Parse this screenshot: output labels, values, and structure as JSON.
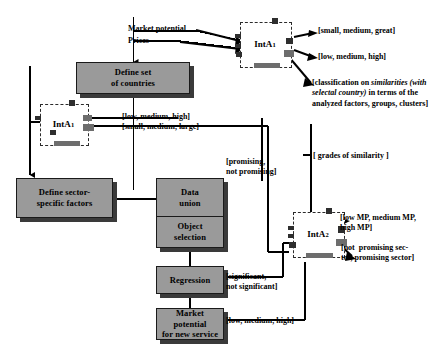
{
  "diagram": {
    "colors": {
      "box_fill": "#9a9a9a",
      "box_border": "#1a1a1a",
      "box_shadow": "#3a3a3a",
      "node_fill": "#ffffff",
      "node_border": "#2b2b2b",
      "line": "#000000",
      "background": "#ffffff"
    },
    "process_boxes": [
      {
        "id": "define-set-of-countries",
        "lines": [
          "Define set",
          "of countries"
        ]
      },
      {
        "id": "define-sector-specific-factors",
        "lines": [
          "Define sector-",
          "specific factors"
        ]
      },
      {
        "id": "data-union",
        "lines": [
          "Data",
          "union"
        ]
      },
      {
        "id": "object-selection",
        "lines": [
          "Object",
          "selection"
        ]
      },
      {
        "id": "regression",
        "lines": [
          "Regression"
        ]
      },
      {
        "id": "market-potential-for-new-service",
        "lines": [
          "Market potential",
          "for new service"
        ]
      }
    ],
    "interaction_nodes": [
      {
        "id": "inta1-top",
        "base": "IntA",
        "subscript": "1"
      },
      {
        "id": "inta1-left",
        "base": "IntA",
        "subscript": "1"
      },
      {
        "id": "inta2",
        "base": "IntA",
        "subscript": "2"
      }
    ],
    "input_labels": [
      {
        "id": "market-potential",
        "text": "Market potential"
      },
      {
        "id": "prices",
        "text": "Prices"
      }
    ],
    "annotations": [
      {
        "id": "small-medium-great",
        "text": "[small, medium, great]"
      },
      {
        "id": "low-medium-high-top",
        "text": "[low, medium, high]"
      },
      {
        "id": "classification-similarities",
        "parts": [
          {
            "text": "[classification on ",
            "italic": false
          },
          {
            "text": "similarities",
            "italic": true
          },
          {
            "text": " ",
            "italic": false
          },
          {
            "text": "(with selectal country)",
            "italic": true
          },
          {
            "text": " in terms of the analyzed factors, groups, clusters]",
            "italic": false
          }
        ],
        "plain": "[classification on similarities (with selectal country) in terms of the analyzed factors, groups, clusters]"
      },
      {
        "id": "low-medium-high-mid",
        "text": "[low, medium, high]"
      },
      {
        "id": "small-medium-large",
        "text": "[small, medium, large]"
      },
      {
        "id": "grades-of-similarity",
        "text": "[ grades of similarity ]"
      },
      {
        "id": "promising-not-promising",
        "text": "[promising,\nnot promising]"
      },
      {
        "id": "low-mp-medium-mp-high-mp",
        "text": "[low MP, medium MP,\nhigh MP]"
      },
      {
        "id": "not-promising-sector",
        "text": "[not  promising sec-\ntor, promising sector]"
      },
      {
        "id": "significant-not-significant",
        "text": "[significant,\nnot significant]"
      },
      {
        "id": "low-medium-high-bottom",
        "text": "[low, medium, high]"
      }
    ]
  }
}
